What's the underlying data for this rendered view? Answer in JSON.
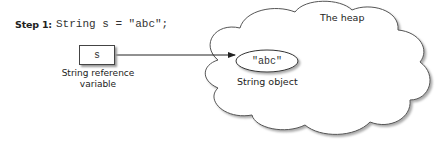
{
  "diagram": {
    "step": {
      "label": "Step 1:",
      "code": "String s = \"abc\";"
    },
    "reference": {
      "variable_name": "s",
      "caption_line1": "String reference",
      "caption_line2": "variable"
    },
    "heap": {
      "title": "The heap",
      "object_value": "\"abc\"",
      "object_caption": "String object"
    },
    "arrow": {
      "from": "reference-box",
      "to": "string-object"
    },
    "colors": {
      "stroke": "#444444",
      "shadow": "#999999",
      "text": "#222222",
      "background": "#ffffff"
    }
  }
}
